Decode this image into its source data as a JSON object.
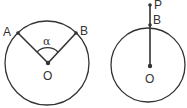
{
  "figures": [
    {
      "name": "central-angle-figure",
      "labels": {
        "A": "A",
        "B": "B",
        "O": "O",
        "angle": "α"
      }
    },
    {
      "name": "external-point-figure",
      "labels": {
        "P": "P",
        "B": "B",
        "O": "O"
      }
    }
  ],
  "colors": {
    "stroke": "#333333",
    "background": "#ffffff"
  }
}
